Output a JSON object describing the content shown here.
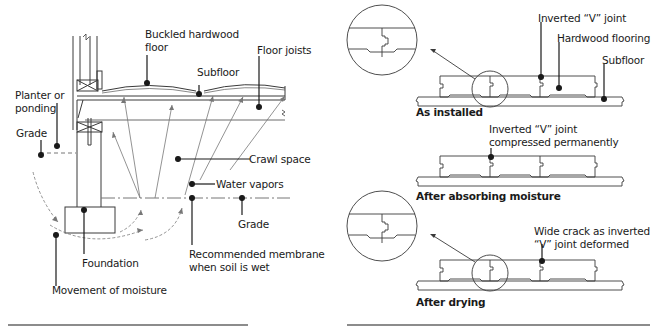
{
  "left_diagram": {
    "title": "Crawl space moisture causing buckled hardwood floor",
    "labels": {
      "buckled_floor_line1": "Buckled hardwood",
      "buckled_floor_line2": "floor",
      "floor_joists": "Floor joists",
      "subfloor": "Subfloor",
      "planter_line1": "Planter or",
      "planter_line2": "ponding",
      "grade_left": "Grade",
      "crawl_space": "Crawl space",
      "water_vapors": "Water vapors",
      "grade_right": "Grade",
      "foundation": "Foundation",
      "membrane_line1": "Recommended membrane",
      "membrane_line2": "when soil is wet",
      "movement": "Movement of moisture"
    }
  },
  "right_diagram": {
    "stages": [
      {
        "caption": "As installed",
        "labels": {
          "joint": "Inverted “V” joint",
          "flooring": "Hardwood flooring",
          "subfloor": "Subfloor"
        }
      },
      {
        "caption": "After absorbing moisture",
        "labels": {
          "joint_line1": "Inverted “V” joint",
          "joint_line2": "compressed permanently"
        }
      },
      {
        "caption": "After drying",
        "labels": {
          "crack_line1": "Wide crack as inverted",
          "crack_line2": "“V” joint deformed"
        }
      }
    ]
  },
  "colors": {
    "ink": "#1a1a1a",
    "line": "#3a3a3a",
    "light_line": "#8a8a8a",
    "divider": "#8c8c8c"
  }
}
